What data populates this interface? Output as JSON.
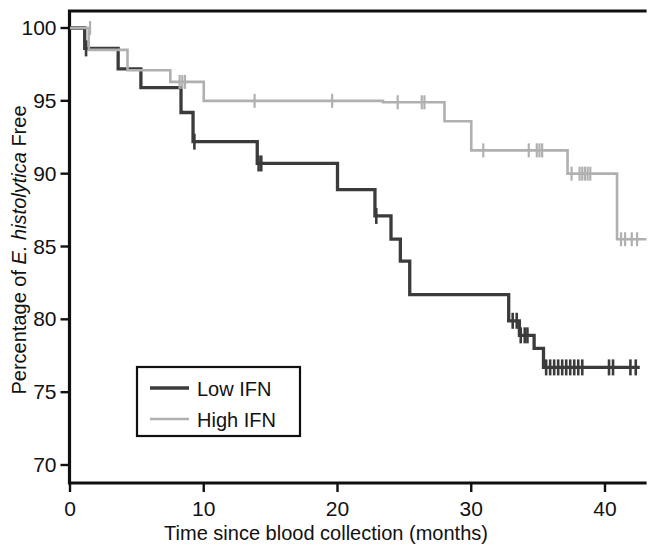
{
  "figure": {
    "background_color": "#ffffff",
    "axis_color": "#101010"
  },
  "chart_data": {
    "type": "line",
    "subtype": "kaplan-meier-step",
    "title": "",
    "xlabel": "Time since blood collection (months)",
    "ylabel_plain": "Percentage of E. histolytica Free",
    "ylabel_parts": {
      "prefix": "Percentage of ",
      "italic": "E. histolytica",
      "suffix": " Free"
    },
    "xlim": [
      0,
      43.5
    ],
    "ylim": [
      69,
      101
    ],
    "xticks": [
      0,
      10,
      20,
      30,
      40
    ],
    "xtick_labels": [
      "0",
      "10",
      "20",
      "30",
      "40"
    ],
    "yticks": [
      70,
      75,
      80,
      85,
      90,
      95,
      100
    ],
    "ytick_labels": [
      "70",
      "75",
      "80",
      "85",
      "90",
      "95",
      "100"
    ],
    "grid": false,
    "legend_position": "lower-left-inside",
    "series": [
      {
        "name": "Low IFN",
        "color": "#3b3b3b",
        "line_width": 3.3,
        "steps": [
          [
            0.0,
            100.0
          ],
          [
            1.1,
            100.0
          ],
          [
            1.1,
            98.6
          ],
          [
            3.6,
            98.6
          ],
          [
            3.6,
            97.2
          ],
          [
            5.3,
            97.2
          ],
          [
            5.3,
            95.9
          ],
          [
            8.3,
            95.9
          ],
          [
            8.3,
            94.2
          ],
          [
            9.2,
            94.2
          ],
          [
            9.2,
            92.2
          ],
          [
            14.0,
            92.2
          ],
          [
            14.0,
            90.7
          ],
          [
            20.0,
            90.7
          ],
          [
            20.0,
            88.9
          ],
          [
            22.8,
            88.9
          ],
          [
            22.8,
            87.1
          ],
          [
            24.0,
            87.1
          ],
          [
            24.0,
            85.5
          ],
          [
            24.7,
            85.5
          ],
          [
            24.7,
            84.0
          ],
          [
            25.4,
            84.0
          ],
          [
            25.4,
            81.7
          ],
          [
            26.5,
            81.7
          ],
          [
            26.5,
            81.7
          ],
          [
            32.8,
            81.7
          ],
          [
            32.8,
            79.9
          ],
          [
            33.6,
            79.9
          ],
          [
            33.6,
            78.9
          ],
          [
            34.7,
            78.9
          ],
          [
            34.7,
            78.0
          ],
          [
            35.4,
            78.0
          ],
          [
            35.4,
            76.7
          ],
          [
            42.6,
            76.7
          ]
        ],
        "censor_times": [
          1.2,
          9.3,
          14.1,
          14.3,
          22.9,
          33.1,
          33.4,
          33.7,
          34.0,
          34.2,
          35.6,
          35.9,
          36.2,
          36.5,
          36.8,
          37.1,
          37.4,
          37.7,
          38.0,
          38.3,
          40.3,
          40.6,
          41.9,
          42.3
        ],
        "censor_values": [
          98.6,
          92.2,
          90.7,
          90.7,
          87.1,
          79.9,
          79.9,
          78.9,
          78.9,
          78.9,
          76.7,
          76.7,
          76.7,
          76.7,
          76.7,
          76.7,
          76.7,
          76.7,
          76.7,
          76.7,
          76.7,
          76.7,
          76.7,
          76.7
        ]
      },
      {
        "name": "High IFN",
        "color": "#b0b0b0",
        "line_width": 2.6,
        "steps": [
          [
            0.0,
            100.0
          ],
          [
            1.4,
            100.0
          ],
          [
            1.4,
            98.5
          ],
          [
            4.3,
            98.5
          ],
          [
            4.3,
            97.1
          ],
          [
            7.5,
            97.1
          ],
          [
            7.5,
            96.3
          ],
          [
            10.0,
            96.3
          ],
          [
            10.0,
            95.0
          ],
          [
            15.5,
            95.0
          ],
          [
            15.5,
            95.0
          ],
          [
            23.4,
            95.0
          ],
          [
            23.4,
            94.9
          ],
          [
            28.0,
            94.9
          ],
          [
            28.0,
            93.6
          ],
          [
            30.0,
            93.6
          ],
          [
            30.0,
            91.6
          ],
          [
            37.2,
            91.6
          ],
          [
            37.2,
            90.0
          ],
          [
            40.9,
            90.0
          ],
          [
            40.9,
            85.5
          ],
          [
            43.1,
            85.5
          ]
        ],
        "censor_times": [
          1.5,
          8.2,
          8.4,
          8.6,
          13.8,
          19.6,
          24.5,
          26.3,
          26.5,
          30.9,
          34.3,
          34.9,
          35.1,
          35.3,
          37.5,
          38.1,
          38.3,
          38.5,
          38.7,
          38.9,
          41.2,
          41.5,
          42.0,
          42.4
        ],
        "censor_values": [
          100.0,
          96.3,
          96.3,
          96.3,
          95.0,
          95.0,
          94.9,
          94.9,
          94.9,
          91.6,
          91.6,
          91.6,
          91.6,
          91.6,
          90.0,
          90.0,
          90.0,
          90.0,
          90.0,
          90.0,
          85.5,
          85.5,
          85.5,
          85.5
        ]
      }
    ],
    "legend": {
      "entries": [
        {
          "label": "Low IFN",
          "color": "#3b3b3b"
        },
        {
          "label": "High IFN",
          "color": "#b0b0b0"
        }
      ]
    }
  }
}
